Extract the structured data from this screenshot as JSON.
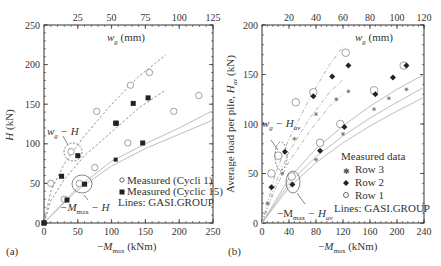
{
  "chart_data": [
    {
      "panel": "(a)",
      "type": "scatter",
      "xlabel": "-M_max (kNm)",
      "ylabel": "H (kN)",
      "top_xlabel": "w_g (mm)",
      "xlim": [
        0,
        250
      ],
      "ylim": [
        0,
        250
      ],
      "top_xlim": [
        0,
        125
      ],
      "x_ticks": [
        "0",
        "50",
        "100",
        "150",
        "200",
        "250"
      ],
      "y_ticks": [
        "0",
        "50",
        "100",
        "150",
        "200",
        "250"
      ],
      "top_x_ticks": [
        "25",
        "50",
        "75",
        "100",
        "125"
      ],
      "annotations": [
        "w_g − H",
        "−M_max − H"
      ],
      "legend": {
        "entries": [
          "Measured (Cycli 1)",
          "Measured (Cyclic 15)"
        ],
        "note": "Lines: GASI.GROUP"
      },
      "series": [
        {
          "name": "Measured (Cycli 1) vs w_g",
          "marker": "open-circle",
          "axis": "top",
          "points": [
            [
              5,
              50
            ],
            [
              20,
              90
            ],
            [
              39,
              141
            ],
            [
              64,
              174
            ],
            [
              78,
              190
            ]
          ]
        },
        {
          "name": "Measured (Cyclic 15) vs w_g",
          "marker": "filled-square",
          "axis": "top",
          "points": [
            [
              0,
              0
            ],
            [
              13,
              59
            ],
            [
              25,
              85
            ],
            [
              53,
              126
            ],
            [
              66,
              151
            ],
            [
              77,
              158
            ]
          ]
        },
        {
          "name": "Measured (Cycli 1) vs M_max",
          "marker": "open-circle",
          "axis": "bottom",
          "points": [
            [
              30,
              30
            ],
            [
              52,
              50
            ],
            [
              75,
              70
            ],
            [
              124,
              101
            ],
            [
              192,
              141
            ],
            [
              229,
              161
            ]
          ]
        },
        {
          "name": "Measured (Cyclic 15) vs M_max",
          "marker": "filled-square",
          "axis": "bottom",
          "points": [
            [
              0,
              0
            ],
            [
              34,
              29
            ],
            [
              60,
              49
            ],
            [
              106,
              80
            ],
            [
              107,
              126
            ],
            [
              146,
              101
            ]
          ]
        }
      ],
      "lines": [
        {
          "name": "GASI.GROUP w_g-H upper (dashed)",
          "style": "dashed",
          "axis": "top",
          "points": [
            [
              0,
              0
            ],
            [
              5,
              40
            ],
            [
              15,
              75
            ],
            [
              30,
              110
            ],
            [
              50,
              150
            ],
            [
              70,
              185
            ],
            [
              90,
              212
            ]
          ]
        },
        {
          "name": "GASI.GROUP w_g-H lower (dashed)",
          "style": "dashed",
          "axis": "top",
          "points": [
            [
              0,
              0
            ],
            [
              5,
              28
            ],
            [
              15,
              55
            ],
            [
              30,
              85
            ],
            [
              50,
              115
            ],
            [
              70,
              145
            ],
            [
              90,
              168
            ]
          ]
        },
        {
          "name": "GASI.GROUP M-H upper (solid)",
          "style": "solid",
          "axis": "bottom",
          "points": [
            [
              0,
              0
            ],
            [
              50,
              45
            ],
            [
              100,
              78
            ],
            [
              150,
              100
            ],
            [
              200,
              120
            ],
            [
              250,
              142
            ]
          ]
        },
        {
          "name": "GASI.GROUP M-H lower (solid)",
          "style": "solid",
          "axis": "bottom",
          "points": [
            [
              0,
              0
            ],
            [
              50,
              42
            ],
            [
              100,
              72
            ],
            [
              150,
              94
            ],
            [
              200,
              112
            ],
            [
              250,
              130
            ]
          ]
        }
      ]
    },
    {
      "panel": "(b)",
      "type": "scatter",
      "xlabel": "-M_max (kNm)",
      "ylabel": "Average load per pile, H_av (kN)",
      "top_xlabel": "w_g (mm)",
      "xlim": [
        0,
        240
      ],
      "ylim": [
        0,
        200
      ],
      "top_xlim": [
        0,
        120
      ],
      "x_ticks": [
        "0",
        "40",
        "80",
        "120",
        "160",
        "200",
        "240"
      ],
      "y_ticks": [
        "0",
        "50",
        "100",
        "150",
        "200"
      ],
      "top_x_ticks": [
        "20",
        "40",
        "60",
        "80",
        "100",
        "120"
      ],
      "annotations": [
        "w_g − H_av",
        "−M_max − H_av"
      ],
      "legend": {
        "title": "Measured data",
        "entries": [
          "Row 3",
          "Row 2",
          "Row 1"
        ],
        "note": "Lines: GASI.GROUP"
      },
      "series": [
        {
          "name": "Row 1 vs w_g",
          "marker": "open-circle",
          "axis": "top",
          "points": [
            [
              7,
              50
            ],
            [
              12,
              68
            ],
            [
              25,
              122
            ],
            [
              38,
              132
            ],
            [
              62,
              172
            ]
          ]
        },
        {
          "name": "Row 2 vs w_g",
          "marker": "filled-diamond",
          "axis": "top",
          "points": [
            [
              7,
              36
            ],
            [
              17,
              72
            ],
            [
              38,
              128
            ],
            [
              52,
              148
            ],
            [
              64,
              159
            ]
          ]
        },
        {
          "name": "Row 3 vs w_g",
          "marker": "asterisk",
          "axis": "top",
          "points": [
            [
              4,
              20
            ],
            [
              15,
              50
            ],
            [
              24,
              85
            ],
            [
              40,
              110
            ],
            [
              55,
              125
            ],
            [
              64,
              133
            ]
          ]
        },
        {
          "name": "Row 1 vs M_max",
          "marker": "open-circle",
          "axis": "bottom",
          "points": [
            [
              44,
              47
            ],
            [
              86,
              81
            ],
            [
              116,
              100
            ],
            [
              166,
              134
            ],
            [
              210,
              159
            ]
          ]
        },
        {
          "name": "Row 2 vs M_max",
          "marker": "filled-diamond",
          "axis": "bottom",
          "points": [
            [
              45,
              39
            ],
            [
              86,
              73
            ],
            [
              122,
              97
            ],
            [
              168,
              130
            ],
            [
              194,
              147
            ],
            [
              214,
              159
            ]
          ]
        },
        {
          "name": "Row 3 vs M_max",
          "marker": "asterisk",
          "axis": "bottom",
          "points": [
            [
              80,
              64
            ],
            [
              120,
              90
            ],
            [
              166,
              115
            ],
            [
              188,
              126
            ],
            [
              214,
              135
            ]
          ]
        }
      ],
      "lines": [
        {
          "name": "GASI.GROUP w_g-H_av 1 (dash-dot)",
          "style": "dashdot",
          "axis": "top",
          "points": [
            [
              0,
              0
            ],
            [
              10,
              50
            ],
            [
              20,
              85
            ],
            [
              35,
              125
            ],
            [
              50,
              160
            ],
            [
              60,
              178
            ]
          ]
        },
        {
          "name": "GASI.GROUP w_g-H_av 2 (dash-dot)",
          "style": "dashdot",
          "axis": "top",
          "points": [
            [
              0,
              0
            ],
            [
              10,
              40
            ],
            [
              20,
              72
            ],
            [
              35,
              105
            ],
            [
              50,
              132
            ],
            [
              60,
              145
            ]
          ]
        },
        {
          "name": "GASI.GROUP w_g-H_av 3 (dash-dot)",
          "style": "dashdot",
          "axis": "top",
          "points": [
            [
              0,
              0
            ],
            [
              10,
              35
            ],
            [
              20,
              62
            ],
            [
              35,
              92
            ],
            [
              50,
              118
            ],
            [
              60,
              130
            ]
          ]
        },
        {
          "name": "GASI.GROUP M-H_av 1 (solid)",
          "style": "solid",
          "axis": "bottom",
          "points": [
            [
              0,
              0
            ],
            [
              40,
              45
            ],
            [
              80,
              75
            ],
            [
              120,
              98
            ],
            [
              160,
              118
            ],
            [
              200,
              135
            ],
            [
              240,
              150
            ]
          ]
        },
        {
          "name": "GASI.GROUP M-H_av 2 (solid)",
          "style": "solid",
          "axis": "bottom",
          "points": [
            [
              0,
              0
            ],
            [
              40,
              40
            ],
            [
              80,
              67
            ],
            [
              120,
              88
            ],
            [
              160,
              106
            ],
            [
              200,
              122
            ],
            [
              240,
              137
            ]
          ]
        },
        {
          "name": "GASI.GROUP M-H_av 3 (solid)",
          "style": "solid",
          "axis": "bottom",
          "points": [
            [
              0,
              0
            ],
            [
              40,
              36
            ],
            [
              80,
              61
            ],
            [
              120,
              81
            ],
            [
              160,
              98
            ],
            [
              200,
              113
            ],
            [
              240,
              127
            ]
          ]
        }
      ]
    }
  ],
  "panels": {
    "a": {
      "label": "(a)",
      "xlabel_prefix": "−",
      "xlabel_var": "M",
      "xlabel_sub": "max",
      "xlabel_unit": " (kNm)",
      "ylabel_var": "H",
      "ylabel_unit": " (kN)",
      "top_label_var": "w",
      "top_label_sub": "g",
      "top_label_unit": " (mm)",
      "annot_wg_var": "w",
      "annot_wg_sub": "g",
      "annot_wg_rest": " − H",
      "annot_m_prefix": "−M",
      "annot_m_sub": "max",
      "annot_m_rest": " − H",
      "legend_1": "Measured (Cycli 1)",
      "legend_2": "Measured (Cyclic 15)",
      "legend_note": "Lines: GASI.GROUP"
    },
    "b": {
      "label": "(b)",
      "xlabel_prefix": "−",
      "xlabel_var": "M",
      "xlabel_sub": "max",
      "xlabel_unit": " (kNm)",
      "ylabel_text": "Average load per pile, ",
      "ylabel_var": "H",
      "ylabel_sub": "av",
      "ylabel_unit": " (kN)",
      "top_label_var": "w",
      "top_label_sub": "g",
      "top_label_unit": " (mm)",
      "annot_wg_var": "w",
      "annot_wg_sub": "g",
      "annot_wg_rest": " − H",
      "annot_wg_rest_sub": "av",
      "annot_m_prefix": "−M",
      "annot_m_sub": "max",
      "annot_m_rest": " − H",
      "annot_m_rest_sub": "av",
      "legend_title": "Measured data",
      "legend_1": "Row 3",
      "legend_2": "Row 2",
      "legend_3": "Row 1",
      "legend_note": "Lines: GASI.GROUP"
    }
  }
}
